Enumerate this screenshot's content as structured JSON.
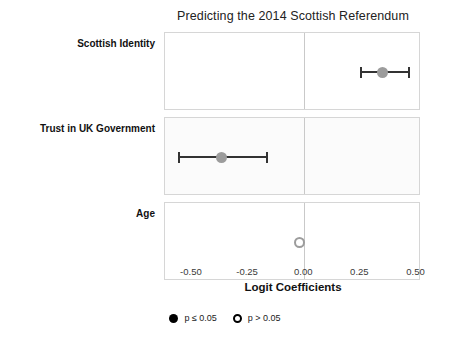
{
  "chart_data": {
    "type": "scatter",
    "subtype": "coefficient-plot",
    "title": "Predicting the 2014 Scottish Referendum",
    "xlabel": "Logit Coefficients",
    "ylabel": "",
    "xlim": [
      -0.62,
      0.52
    ],
    "xticks": [
      -0.5,
      -0.25,
      0.0,
      0.25,
      0.5
    ],
    "xticklabels": [
      "-0.50",
      "-0.25",
      "0.00",
      "0.25",
      "0.50"
    ],
    "grid": false,
    "zero_reference_line": 0.0,
    "legend_position": "bottom",
    "categories": [
      "Scottish Identity",
      "Trust in UK Government",
      "Age"
    ],
    "values": [
      0.35,
      -0.37,
      -0.02
    ],
    "ci_low": [
      0.25,
      -0.56,
      -0.02
    ],
    "ci_high": [
      0.46,
      -0.17,
      -0.02
    ],
    "points": [
      {
        "label": "Scottish Identity",
        "estimate": 0.35,
        "ci_low": 0.25,
        "ci_high": 0.46,
        "significance": "p <= 0.05",
        "panel_shaded": false
      },
      {
        "label": "Trust in UK Government",
        "estimate": -0.37,
        "ci_low": -0.56,
        "ci_high": -0.17,
        "significance": "p <= 0.05",
        "panel_shaded": true
      },
      {
        "label": "Age",
        "estimate": -0.02,
        "ci_low": -0.02,
        "ci_high": -0.02,
        "significance": "p > 0.05",
        "panel_shaded": false
      }
    ],
    "legend": [
      {
        "marker": "filled-circle",
        "label": "p ≤ 0.05"
      },
      {
        "marker": "hollow-circle",
        "label": "p > 0.05"
      }
    ],
    "colors": {
      "point": "#9c9c9c",
      "error_bar": "#333333",
      "panel_border": "#d6d6d6",
      "zero_line": "#c9c9c9",
      "background": "#ffffff",
      "shaded_panel": "#fbfbfb",
      "text": "#1a1a1a"
    }
  }
}
